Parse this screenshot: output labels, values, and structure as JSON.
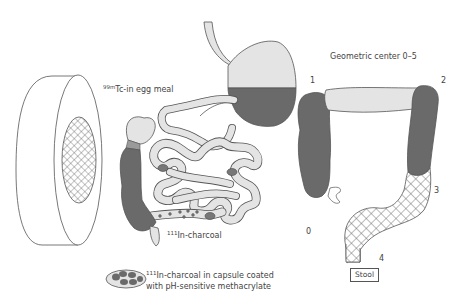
{
  "diagram": {
    "type": "medical-illustration",
    "colors": {
      "dark_fill": "#6a6a6a",
      "light_fill": "#e4e4e4",
      "outline": "#555555",
      "hatch": "#666666",
      "background": "#ffffff"
    },
    "labels": {
      "egg_meal_isotope": "99m",
      "egg_meal_text": "Tc-in egg meal",
      "charcoal_isotope": "111",
      "charcoal_text": "In-charcoal",
      "capsule_isotope": "111",
      "capsule_line1": "In-charcoal in capsule coated",
      "capsule_line2": "with pH-sensitive methacrylate",
      "geometric_center_title": "Geometric center 0–5",
      "stool": "Stool"
    },
    "colon_regions": [
      {
        "number": "0",
        "region": "cecum / ascending colon start"
      },
      {
        "number": "1",
        "region": "hepatic flexure"
      },
      {
        "number": "2",
        "region": "splenic flexure"
      },
      {
        "number": "3",
        "region": "descending colon"
      },
      {
        "number": "4",
        "region": "rectosigmoid"
      }
    ],
    "components": [
      "gamma-camera-detector",
      "stomach",
      "small-intestine",
      "colon-left",
      "colon-right-schematic",
      "capsule-legend"
    ]
  }
}
